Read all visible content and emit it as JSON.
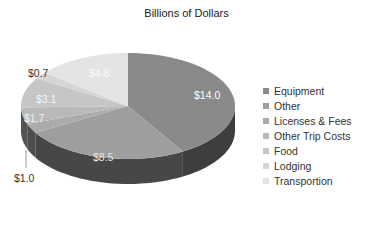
{
  "chart_data": {
    "type": "pie",
    "style": "3d",
    "title": "Billions of Dollars",
    "unit": "$ billions",
    "categories": [
      "Equipment",
      "Other",
      "Licenses & Fees",
      "Other Trip Costs",
      "Food",
      "Lodging",
      "Transportion"
    ],
    "values": [
      14.0,
      8.5,
      1.0,
      1.7,
      3.1,
      0.7,
      4.8
    ],
    "data_labels": [
      "$14.0",
      "$8.5",
      "$1.0",
      "$1.7",
      "$3.1",
      "$0.7",
      "$4.8"
    ],
    "colors": [
      "#8a8a8a",
      "#9e9e9e",
      "#ababab",
      "#b9b9b9",
      "#c6c6c6",
      "#d5d5d5",
      "#e4e4e4"
    ],
    "legend_position": "right"
  },
  "legend": {
    "items": [
      {
        "label": "Equipment",
        "color": "#8a8a8a"
      },
      {
        "label": "Other",
        "color": "#9e9e9e"
      },
      {
        "label": "Licenses & Fees",
        "color": "#ababab"
      },
      {
        "label": "Other Trip Costs",
        "color": "#b9b9b9"
      },
      {
        "label": "Food",
        "color": "#c6c6c6"
      },
      {
        "label": "Lodging",
        "color": "#d5d5d5"
      },
      {
        "label": "Transportion",
        "color": "#e4e4e4"
      }
    ]
  }
}
